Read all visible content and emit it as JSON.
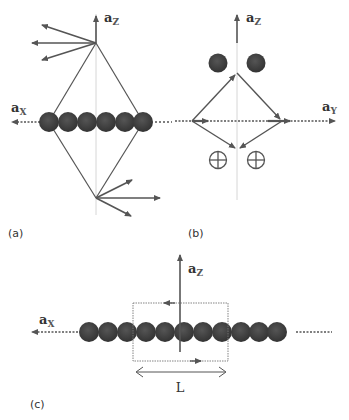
{
  "panels": {
    "a": {
      "label": "(a)",
      "axis_x": {
        "vec": "a",
        "sub": "X"
      },
      "axis_z": {
        "vec": "a",
        "sub": "Z"
      }
    },
    "b": {
      "label": "(b)",
      "axis_y": {
        "vec": "a",
        "sub": "Y"
      },
      "axis_z": {
        "vec": "a",
        "sub": "Z"
      }
    },
    "c": {
      "label": "(c)",
      "axis_x": {
        "vec": "a",
        "sub": "X"
      },
      "axis_z": {
        "vec": "a",
        "sub": "Z"
      },
      "length_label": "L"
    }
  },
  "colors": {
    "atom": "#3e3e3e",
    "line": "#555555",
    "guide": "#bbbbbb"
  }
}
